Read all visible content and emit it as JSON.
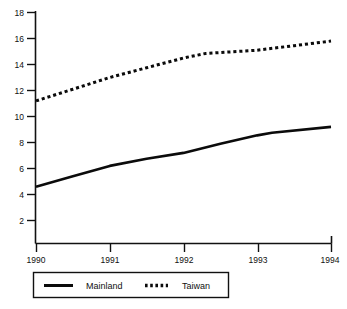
{
  "chart_data": {
    "type": "line",
    "title": "",
    "subtitle": "",
    "xlabel": "",
    "ylabel": "",
    "x": [
      1990,
      1991,
      1992,
      1993,
      1994
    ],
    "categories": [
      "1990",
      "1991",
      "1992",
      "1993",
      "1994"
    ],
    "xlim": [
      1990,
      1994
    ],
    "ylim": [
      0,
      18
    ],
    "grid": false,
    "legend_position": "bottom",
    "y_ticks": [
      2,
      4,
      6,
      8,
      10,
      12,
      14,
      16,
      18
    ],
    "y_tick_labels": [
      "2",
      "4",
      "6",
      "8",
      "10",
      "12",
      "14",
      "16",
      "18"
    ],
    "x_ticks": [
      1990,
      1991,
      1992,
      1993,
      1994
    ],
    "x_tick_labels": [
      "1990",
      "1991",
      "1992",
      "1993",
      "1994"
    ],
    "series": [
      {
        "name": "Mainland",
        "style": "solid",
        "color": "#0b0b0b",
        "values": [
          4.6,
          6.2,
          7.2,
          8.7,
          9.2
        ],
        "detail_points": [
          {
            "x": 1990.0,
            "y": 4.6
          },
          {
            "x": 1990.5,
            "y": 5.4
          },
          {
            "x": 1991.0,
            "y": 6.2
          },
          {
            "x": 1991.5,
            "y": 6.75
          },
          {
            "x": 1992.0,
            "y": 7.2
          },
          {
            "x": 1992.5,
            "y": 7.9
          },
          {
            "x": 1993.0,
            "y": 8.55
          },
          {
            "x": 1993.2,
            "y": 8.75
          },
          {
            "x": 1994.0,
            "y": 9.2
          }
        ]
      },
      {
        "name": "Taiwan",
        "style": "dotted",
        "color": "#0b0b0b",
        "values": [
          11.2,
          13.0,
          14.5,
          15.1,
          15.8
        ],
        "detail_points": [
          {
            "x": 1990.0,
            "y": 11.2
          },
          {
            "x": 1990.5,
            "y": 12.1
          },
          {
            "x": 1991.0,
            "y": 13.0
          },
          {
            "x": 1991.5,
            "y": 13.75
          },
          {
            "x": 1992.0,
            "y": 14.5
          },
          {
            "x": 1992.3,
            "y": 14.85
          },
          {
            "x": 1993.0,
            "y": 15.1
          },
          {
            "x": 1993.5,
            "y": 15.45
          },
          {
            "x": 1994.0,
            "y": 15.8
          }
        ]
      }
    ],
    "legend": [
      {
        "label": "Mainland",
        "style": "solid"
      },
      {
        "label": "Taiwan",
        "style": "dotted"
      }
    ]
  }
}
